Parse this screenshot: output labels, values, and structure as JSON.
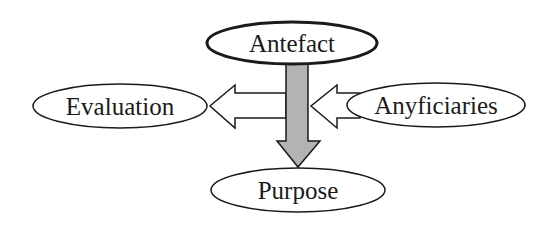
{
  "diagram": {
    "nodes": [
      {
        "id": "antefact",
        "label": "Antefact",
        "cx": 292,
        "cy": 43,
        "rx": 85,
        "ry": 21,
        "stroke_width": 3
      },
      {
        "id": "evaluation",
        "label": "Evaluation",
        "cx": 120,
        "cy": 106,
        "rx": 87,
        "ry": 22,
        "stroke_width": 1.5
      },
      {
        "id": "anyficiaries",
        "label": "Anyficiaries",
        "cx": 436,
        "cy": 105,
        "rx": 89,
        "ry": 22,
        "stroke_width": 1.5
      },
      {
        "id": "purpose",
        "label": "Purpose",
        "cx": 298,
        "cy": 190,
        "rx": 87,
        "ry": 22,
        "stroke_width": 1.5
      }
    ],
    "edges": [
      {
        "from": "antefact",
        "to": "purpose",
        "style": "filled",
        "fill": "#b3b3b3"
      },
      {
        "from": "antefact-purpose-axis",
        "to": "evaluation",
        "style": "hollow",
        "fill": "#ffffff"
      },
      {
        "from": "anyficiaries",
        "to": "antefact-purpose-axis",
        "style": "hollow",
        "fill": "#ffffff"
      }
    ],
    "colors": {
      "stroke": "#1a1a1a",
      "background": "#ffffff",
      "main_arrow_fill": "#b3b3b3"
    }
  }
}
